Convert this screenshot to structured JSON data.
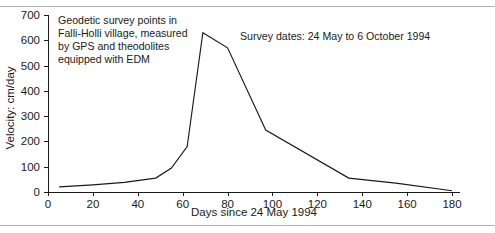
{
  "chart_data": {
    "type": "line",
    "title": "",
    "xlabel": "Days since 24 May 1994",
    "ylabel": "Velocity: cm/day",
    "xlim": [
      0,
      180
    ],
    "ylim": [
      0,
      700
    ],
    "xticks": [
      0,
      20,
      40,
      60,
      80,
      100,
      120,
      140,
      160,
      180
    ],
    "yticks": [
      0,
      100,
      200,
      300,
      400,
      500,
      600,
      700
    ],
    "grid": false,
    "legend": null,
    "series": [
      {
        "name": "Surface velocity",
        "x": [
          5,
          20,
          34,
          48,
          55,
          62,
          69,
          80,
          97,
          134,
          155,
          180
        ],
        "values": [
          20,
          28,
          38,
          55,
          95,
          180,
          630,
          570,
          245,
          55,
          35,
          5
        ]
      }
    ],
    "annotations": [
      {
        "name": "description",
        "lines": [
          "Geodetic survey points in",
          "Falli-Holli village, measured",
          "by GPS and theodolites",
          "equipped with EDM"
        ]
      },
      {
        "name": "survey-dates",
        "text": "Survey dates: 24 May to 6 October 1994"
      }
    ]
  },
  "figure": {
    "line_color": "#1a1a1a",
    "axis_color": "#1a1a1a",
    "background": "#ffffff"
  }
}
